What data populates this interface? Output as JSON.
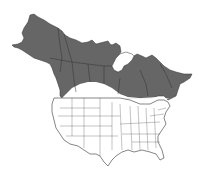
{
  "map": {
    "subject": "North America range map",
    "region_shown": "Canada, Alaska and contiguous United States with state/province borders",
    "range_description": "Shaded range covers Alaska and Canada south to the northern edge of the contiguous US",
    "colors": {
      "background": "#ffffff",
      "range_fill": "#666666",
      "non_range_fill": "#ffffff",
      "border_line": "#333333",
      "state_line": "#555555"
    },
    "legend": null
  }
}
